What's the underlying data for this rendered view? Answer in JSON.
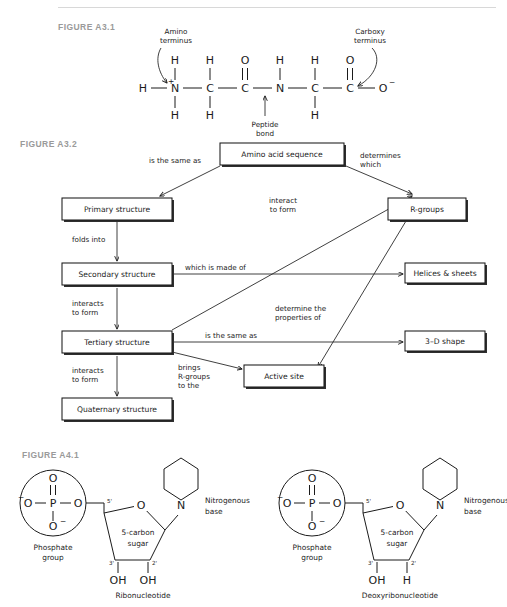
{
  "page": {
    "figures": [
      {
        "id": "a31",
        "label": "FIGURE A3.1"
      },
      {
        "id": "a32",
        "label": "FIGURE A3.2"
      },
      {
        "id": "a41",
        "label": "FIGURE A4.1"
      }
    ]
  },
  "figure_a31": {
    "title": "FIGURE A3.1",
    "description": "Dipeptide backbone structure",
    "annotations": {
      "amino_terminus": "Amino\nterminus",
      "amino_terminus_line1": "Amino",
      "amino_terminus_line2": "terminus",
      "carboxy_terminus_line1": "Carboxy",
      "carboxy_terminus_line2": "terminus",
      "peptide_bond_line1": "Peptide",
      "peptide_bond_line2": "bond"
    },
    "backbone_atoms": [
      "H",
      "N",
      "C",
      "C",
      "N",
      "C",
      "C",
      "O"
    ],
    "charges": {
      "n_terminus": "+",
      "o_terminus": "−"
    },
    "upper_substituents": [
      "H",
      "H",
      "O",
      "H",
      "H",
      "O"
    ],
    "lower_substituents": [
      "H",
      "H",
      "H"
    ]
  },
  "figure_a32": {
    "title": "FIGURE A3.2",
    "description": "Protein structure concept map",
    "nodes": [
      {
        "id": "amino_acid_sequence",
        "label": "Amino acid sequence"
      },
      {
        "id": "primary",
        "label": "Primary structure"
      },
      {
        "id": "secondary",
        "label": "Secondary structure"
      },
      {
        "id": "tertiary",
        "label": "Tertiary structure"
      },
      {
        "id": "quaternary",
        "label": "Quaternary structure"
      },
      {
        "id": "rgroups",
        "label": "R-groups"
      },
      {
        "id": "helices",
        "label": "Helices & sheets"
      },
      {
        "id": "shape",
        "label": "3–D shape"
      },
      {
        "id": "active_site",
        "label": "Active site"
      }
    ],
    "links": [
      {
        "id": "seq_to_primary",
        "from": "amino_acid_sequence",
        "to": "primary",
        "label": "is the same as"
      },
      {
        "id": "seq_to_rgroups",
        "from": "amino_acid_sequence",
        "to": "rgroups",
        "label_line1": "determines",
        "label_line2": "which"
      },
      {
        "id": "primary_to_secondary",
        "from": "primary",
        "to": "secondary",
        "label": "folds into"
      },
      {
        "id": "secondary_to_tertiary",
        "from": "secondary",
        "to": "tertiary",
        "label_line1": "interacts",
        "label_line2": "to form"
      },
      {
        "id": "secondary_to_helices",
        "from": "secondary",
        "to": "helices",
        "label": "which is made of"
      },
      {
        "id": "tertiary_to_rgroups",
        "from": "tertiary",
        "to": "rgroups",
        "label_line1": "interact",
        "label_line2": "to form"
      },
      {
        "id": "tertiary_to_shape",
        "from": "tertiary",
        "to": "shape",
        "label": "is the same as"
      },
      {
        "id": "tertiary_to_quaternary",
        "from": "tertiary",
        "to": "quaternary",
        "label_line1": "interacts",
        "label_line2": "to form"
      },
      {
        "id": "tertiary_to_active_site",
        "from": "tertiary",
        "to": "active_site",
        "label_line1": "brings",
        "label_line2": "R-groups",
        "label_line3": "to the"
      },
      {
        "id": "rgroups_to_active_site",
        "from": "rgroups",
        "to": "active_site",
        "label_line1": "determine the",
        "label_line2": "properties of"
      }
    ]
  },
  "figure_a41": {
    "title": "FIGURE A4.1",
    "description": "Nucleotide structures",
    "structures": [
      {
        "id": "ribonucleotide",
        "name": "Ribonucleotide",
        "phosphate_label_line1": "Phosphate",
        "phosphate_label_line2": "group",
        "phosphate_atoms": {
          "left_o": "O",
          "center": "P",
          "right_o": "O",
          "top_o": "O",
          "bottom_o": "O",
          "left_charge": "−",
          "bottom_charge": "−"
        },
        "sugar_label_line1": "5-carbon",
        "sugar_label_line2": "sugar",
        "ring_oxygen": "O",
        "base_atom": "N",
        "base_label_line1": "Nitrogenous",
        "base_label_line2": "base",
        "carbon_labels": {
          "c5": "5'",
          "c3": "3'",
          "c2": "2'"
        },
        "c3_group": "OH",
        "c2_group": "OH"
      },
      {
        "id": "deoxyribonucleotide",
        "name": "Deoxyribonucleotide",
        "phosphate_label_line1": "Phosphate",
        "phosphate_label_line2": "group",
        "phosphate_atoms": {
          "left_o": "O",
          "center": "P",
          "right_o": "O",
          "top_o": "O",
          "bottom_o": "O",
          "left_charge": "−",
          "bottom_charge": "−"
        },
        "sugar_label_line1": "5-carbon",
        "sugar_label_line2": "sugar",
        "ring_oxygen": "O",
        "base_atom": "N",
        "base_label_line1": "Nitrogenous",
        "base_label_line2": "base",
        "carbon_labels": {
          "c5": "5'",
          "c3": "3'",
          "c2": "2'"
        },
        "c3_group": "OH",
        "c2_group": "H"
      }
    ]
  },
  "colors": {
    "ink": "#1b1b1b",
    "figure_label": "#9a9a9a",
    "rule": "#d8d8d8",
    "background": "#ffffff"
  }
}
